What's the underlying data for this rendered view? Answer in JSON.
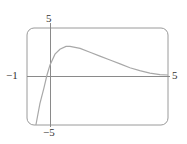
{
  "chart_data": {
    "type": "line",
    "title": "",
    "xlabel": "",
    "ylabel": "",
    "xlim": [
      -1,
      5
    ],
    "ylim": [
      -5,
      5
    ],
    "grid": false,
    "legend": null,
    "tick_labels": {
      "x_min": "−1",
      "x_max": "5",
      "y_max": "5",
      "y_min": "−5"
    },
    "series": [
      {
        "name": "f(x)",
        "x": [
          -0.62,
          -0.45,
          -0.28,
          -0.15,
          -0.02,
          0.19,
          0.4,
          0.66,
          0.83,
          1.26,
          1.68,
          2.1,
          2.53,
          2.96,
          3.38,
          3.8,
          4.23,
          4.66,
          5.0
        ],
        "y": [
          -5.0,
          -2.8,
          -1.2,
          0.15,
          1.2,
          2.3,
          2.8,
          3.1,
          3.1,
          2.9,
          2.5,
          2.1,
          1.7,
          1.3,
          0.9,
          0.6,
          0.35,
          0.2,
          0.15
        ]
      }
    ],
    "colors": {
      "frame": "#9a9a9a",
      "axes": "#8a8a8a",
      "curve": "#a8a8a8"
    }
  }
}
